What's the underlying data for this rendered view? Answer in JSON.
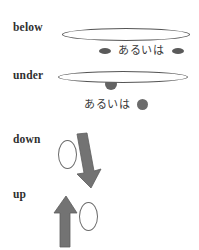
{
  "diagram": {
    "ink_color": "#555555",
    "fill_color": "#6b6b6b",
    "background": "#ffffff",
    "rows": [
      {
        "id": "below",
        "label": "below",
        "shapes": [
          "flat-ellipse",
          "small-filled-ellipse"
        ],
        "alternative": {
          "text": "あるいは",
          "left_marker": "small-filled-ellipse",
          "right_marker": "small-filled-ellipse"
        }
      },
      {
        "id": "under",
        "label": "under",
        "shapes": [
          "flat-ellipse",
          "filled-circle-touching"
        ],
        "alternative": {
          "text": "あるいは",
          "left_marker": null,
          "right_marker": "filled-circle"
        }
      },
      {
        "id": "down",
        "label": "down",
        "shapes": [
          "outline-oval",
          "down-arrow"
        ],
        "alternative": null
      },
      {
        "id": "up",
        "label": "up",
        "shapes": [
          "up-arrow",
          "outline-oval"
        ],
        "alternative": null
      }
    ],
    "labels": {
      "below": "below",
      "under": "under",
      "down": "down",
      "up": "up"
    },
    "japanese": {
      "alternative_1": "あるいは",
      "alternative_2": "あるいは"
    }
  }
}
